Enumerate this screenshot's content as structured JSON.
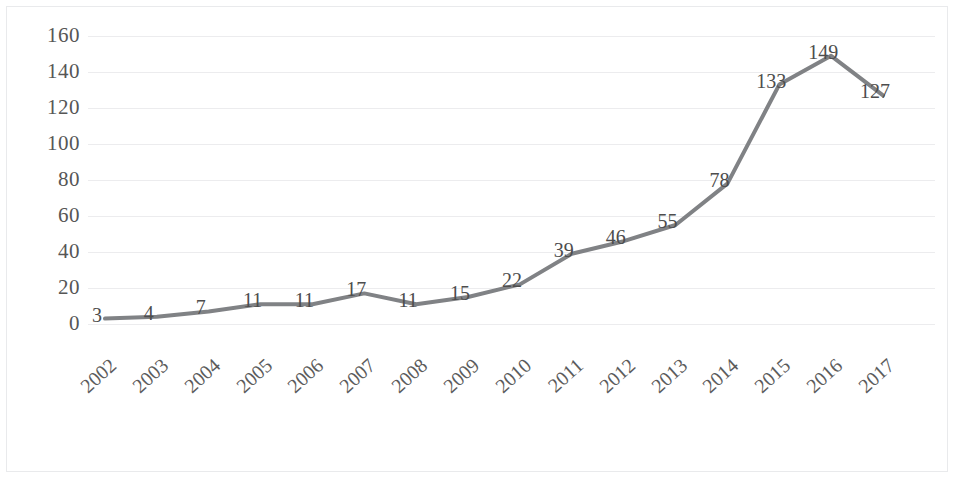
{
  "chart_data": {
    "type": "line",
    "title": "",
    "subtitle": "",
    "xlabel": "",
    "ylabel": "",
    "categories": [
      "2002",
      "2003",
      "2004",
      "2005",
      "2006",
      "2007",
      "2008",
      "2009",
      "2010",
      "2011",
      "2012",
      "2013",
      "2014",
      "2015",
      "2016",
      "2017"
    ],
    "values": [
      3,
      4,
      7,
      11,
      11,
      17,
      11,
      15,
      22,
      39,
      46,
      55,
      78,
      133,
      149,
      127
    ],
    "series": [
      {
        "name": "",
        "values": [
          3,
          4,
          7,
          11,
          11,
          17,
          11,
          15,
          22,
          39,
          46,
          55,
          78,
          133,
          149,
          127
        ]
      }
    ],
    "data_labels": [
      "3",
      "4",
      "7",
      "11",
      "11",
      "17",
      "11",
      "15",
      "22",
      "39",
      "46",
      "55",
      "78",
      "133",
      "149",
      "127"
    ],
    "ylim": [
      0,
      160
    ],
    "ytick_labels": [
      "0",
      "20",
      "40",
      "60",
      "80",
      "100",
      "120",
      "140",
      "160"
    ],
    "ytick_values": [
      0,
      20,
      40,
      60,
      80,
      100,
      120,
      140,
      160
    ],
    "xtick_labels": [
      "2002",
      "2003",
      "2004",
      "2005",
      "2006",
      "2007",
      "2008",
      "2009",
      "2010",
      "2011",
      "2012",
      "2013",
      "2014",
      "2015",
      "2016",
      "2017"
    ],
    "grid": "horizontal",
    "legend": "none",
    "show_data_labels": true,
    "colors": {
      "line": "#808285",
      "gridline": "#ececee",
      "tick_text": "#565656",
      "label_text": "#4d4d4d",
      "frame": "#e9eaec",
      "background": "#ffffff"
    },
    "line_width": 4,
    "markers": "none"
  }
}
